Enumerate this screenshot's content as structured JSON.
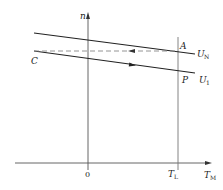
{
  "diagram": {
    "type": "motor mechanical characteristic (n vs T_M)",
    "axes": {
      "y_label": "n",
      "x_label_main": "T",
      "x_label_sub": "M",
      "origin_label": "0"
    },
    "load_line": {
      "label_main": "T",
      "label_sub": "L"
    },
    "curves": [
      {
        "name": "rated-voltage-line",
        "label_main": "U",
        "label_sub": "N"
      },
      {
        "name": "reduced-voltage-line",
        "label_main": "U",
        "label_sub": "1"
      }
    ],
    "points": {
      "A": "A",
      "C": "C",
      "P": "P"
    },
    "colors": {
      "line": "#222222",
      "axis": "#555555",
      "dashed": "#888888",
      "background": "#ffffff"
    }
  }
}
